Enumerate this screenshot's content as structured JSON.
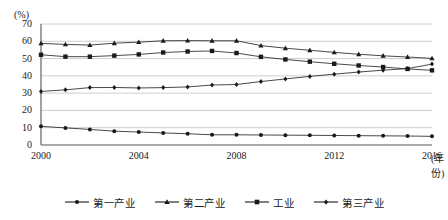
{
  "chart_data": {
    "type": "line",
    "title": "",
    "xlabel": "(年份)",
    "ylabel": "(%)",
    "ylim": [
      0,
      70
    ],
    "ytick_step": 10,
    "grid": true,
    "legend_position": "bottom",
    "x": [
      2000,
      2001,
      2002,
      2003,
      2004,
      2005,
      2006,
      2007,
      2008,
      2009,
      2010,
      2011,
      2012,
      2013,
      2014,
      2015,
      2016
    ],
    "xticks": [
      "2000",
      "2004",
      "2008",
      "2012",
      "2016"
    ],
    "xtick_values": [
      2000,
      2004,
      2008,
      2012,
      2016
    ],
    "yticks": [
      "0",
      "10",
      "20",
      "30",
      "40",
      "50",
      "60",
      "70"
    ],
    "ytick_values": [
      0,
      10,
      20,
      30,
      40,
      50,
      60,
      70
    ],
    "series": [
      {
        "name": "第一产业",
        "marker": "circle",
        "values": [
          10.8,
          9.9,
          9.0,
          8.0,
          7.5,
          7.0,
          6.5,
          5.9,
          5.9,
          5.8,
          5.7,
          5.6,
          5.5,
          5.4,
          5.3,
          5.2,
          5.0
        ]
      },
      {
        "name": "第二产业",
        "marker": "triangle",
        "values": [
          58.8,
          58.2,
          57.8,
          58.9,
          59.5,
          60.3,
          60.4,
          60.3,
          60.3,
          57.5,
          56.0,
          54.8,
          53.6,
          52.5,
          51.6,
          50.9,
          50.1
        ]
      },
      {
        "name": "工业",
        "marker": "square",
        "values": [
          52.2,
          51.1,
          51.1,
          51.7,
          52.4,
          53.5,
          54.1,
          54.4,
          53.2,
          51.0,
          49.5,
          48.2,
          47.0,
          46.0,
          45.1,
          44.0,
          43.2
        ]
      },
      {
        "name": "第三产业",
        "marker": "diamond",
        "values": [
          31.0,
          31.9,
          33.2,
          33.3,
          33.0,
          33.2,
          33.6,
          34.7,
          35.0,
          36.7,
          38.2,
          39.7,
          41.0,
          42.2,
          43.3,
          44.2,
          46.8
        ]
      }
    ]
  },
  "axis": {
    "y_unit": "(%)",
    "x_unit": "(年份)"
  },
  "legend": {
    "items": [
      {
        "label": "第一产业",
        "marker": "circle-marker"
      },
      {
        "label": "第二产业",
        "marker": "triangle-marker"
      },
      {
        "label": "工业",
        "marker": "square-marker"
      },
      {
        "label": "第三产业",
        "marker": "diamond-marker"
      }
    ]
  },
  "colors": {
    "line": "#1a1a1a",
    "grid": "#c8c8c8",
    "axis": "#555555",
    "background": "#ffffff"
  }
}
